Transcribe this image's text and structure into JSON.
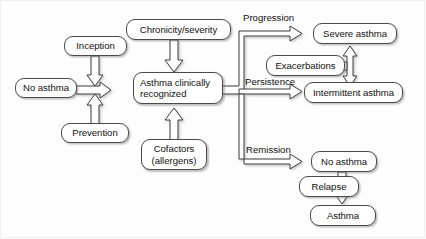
{
  "diagram": {
    "type": "flowchart",
    "background_color": "#fdfdfe",
    "node_border_color": "#4a4a4a",
    "arrow_color": "#333333",
    "text_color": "#111111",
    "nodes": [
      {
        "id": "no-asthma-left",
        "label": "No asthma"
      },
      {
        "id": "inception",
        "label": "Inception"
      },
      {
        "id": "prevention",
        "label": "Prevention"
      },
      {
        "id": "chronicity-severity",
        "label": "Chronicity/severity"
      },
      {
        "id": "asthma-recognized",
        "label": "Asthma clinically recognized"
      },
      {
        "id": "cofactors",
        "label": "Cofactors (allergens)"
      },
      {
        "id": "severe-asthma",
        "label": "Severe asthma"
      },
      {
        "id": "exacerbations",
        "label": "Exacerbations"
      },
      {
        "id": "intermittent-asthma",
        "label": "Intermittent asthma"
      },
      {
        "id": "no-asthma-right",
        "label": "No asthma"
      },
      {
        "id": "relapse",
        "label": "Relapse"
      },
      {
        "id": "asthma-final",
        "label": "Asthma"
      }
    ],
    "node_lines": {
      "asthma_recognized_line1": "Asthma clinically",
      "asthma_recognized_line2": "recognized",
      "cofactors_line1": "Cofactors",
      "cofactors_line2": "(allergens)"
    },
    "edge_labels": [
      {
        "id": "progression",
        "label": "Progression"
      },
      {
        "id": "persistence",
        "label": "Persistence"
      },
      {
        "id": "remission",
        "label": "Remission"
      }
    ],
    "edges": [
      {
        "from": "no-asthma-left",
        "to": "asthma-recognized",
        "label": ""
      },
      {
        "from": "inception",
        "to": "no-asthma-transition",
        "label": ""
      },
      {
        "from": "prevention",
        "to": "no-asthma-transition",
        "label": ""
      },
      {
        "from": "chronicity-severity",
        "to": "asthma-recognized",
        "label": ""
      },
      {
        "from": "cofactors",
        "to": "asthma-recognized",
        "label": ""
      },
      {
        "from": "asthma-recognized",
        "to": "severe-asthma",
        "label": "Progression"
      },
      {
        "from": "asthma-recognized",
        "to": "intermittent-asthma",
        "label": "Persistence"
      },
      {
        "from": "asthma-recognized",
        "to": "no-asthma-right",
        "label": "Remission"
      },
      {
        "from": "severe-asthma",
        "to": "intermittent-asthma",
        "label": "",
        "bidirectional": true
      },
      {
        "from": "exacerbations",
        "to": "severe-intermittent-axis",
        "label": ""
      },
      {
        "from": "no-asthma-right",
        "to": "asthma-final",
        "label": "Relapse"
      }
    ]
  }
}
